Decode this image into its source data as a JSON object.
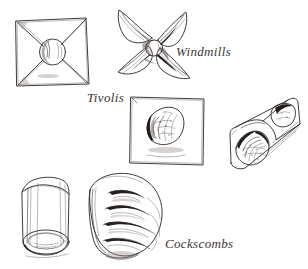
{
  "page": {
    "width": 308,
    "height": 269,
    "background_color": "#ffffff",
    "ink_color": "#2a2623",
    "medium": "pen-and-ink line drawing"
  },
  "labels": [
    {
      "id": "windmills",
      "text": "Windmills",
      "style": "italic-serif",
      "x": 176,
      "y": 45
    },
    {
      "id": "tivolis",
      "text": "Tivolis",
      "style": "italic-serif",
      "x": 87,
      "y": 91
    },
    {
      "id": "cockscombs",
      "text": "Cockscombs",
      "style": "italic-serif",
      "x": 165,
      "y": 237
    }
  ],
  "figures": [
    {
      "id": "windmill-flat",
      "name": "flat square windmill pastry",
      "label_group": "Windmills",
      "description": "Square of dough with four diagonal cuts from the corners toward a shaded round filling at the centre",
      "position": "top-left"
    },
    {
      "id": "windmill-folded",
      "name": "folded pinwheel windmill pastry",
      "label_group": "Windmills",
      "description": "Four curved blades folded inward toward a small shaded centre button",
      "blade_count": 4,
      "position": "top-centre"
    },
    {
      "id": "tivoli-square",
      "name": "tivoli square pastry",
      "label_group": "Tivolis",
      "description": "Square of dough with an oval mound of textured filling set diagonally at the centre",
      "position": "middle-centre"
    },
    {
      "id": "rolled-log-diagonal",
      "name": "diagonal rolled pastry log",
      "label_group": "Tivolis",
      "description": "Rolled tube seen at an angle with filling visible at both open ends",
      "position": "middle-right"
    },
    {
      "id": "rolled-log-upright",
      "name": "upright rolled pastry log",
      "label_group": "Cockscombs",
      "description": "Vertical rolled tube with an open elliptical end at the bottom",
      "position": "bottom-left"
    },
    {
      "id": "cockscomb-fan",
      "name": "cockscomb pastry",
      "label_group": "Cockscombs",
      "description": "Curved fan-shaped pastry with four deep dark slashes forming comb teeth along the outer edge",
      "slash_count": 4,
      "position": "bottom-centre"
    }
  ]
}
